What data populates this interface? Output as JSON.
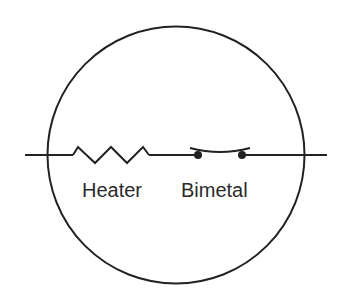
{
  "diagram": {
    "type": "circuit-schematic",
    "enclosure": "circle",
    "components": [
      {
        "id": "heater",
        "symbol": "resistor-zigzag",
        "label": "Heater"
      },
      {
        "id": "bimetal",
        "symbol": "bimetal-switch",
        "label": "Bimetal"
      }
    ],
    "connection": "series",
    "stroke_color": "#222222"
  }
}
